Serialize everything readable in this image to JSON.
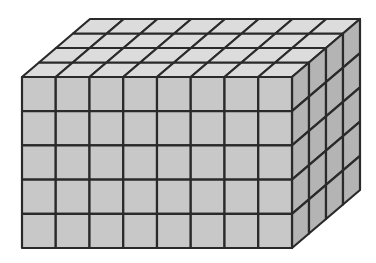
{
  "diagram": {
    "type": "rectangular-prism-of-unit-cubes",
    "dimensions": {
      "length": 8,
      "height": 5,
      "depth": 4
    },
    "geometry": {
      "front_origin": [
        22,
        77
      ],
      "cell_width": 33.75,
      "cell_height": 34.2,
      "depth_step": [
        17,
        -14.5
      ]
    },
    "colors": {
      "front_face": "#c8c8c8",
      "top_face": "#dcdcdc",
      "side_face": "#b4b4b4",
      "grid_line": "#2a2a2a",
      "background": "#ffffff"
    },
    "stroke_width": 2.2
  }
}
